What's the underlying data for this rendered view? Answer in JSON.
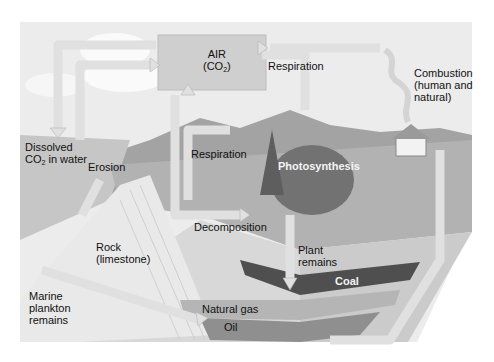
{
  "diagram": {
    "colors": {
      "sky": "#ececec",
      "air_box": "#cfcfcf",
      "arrow": "#e2e2e2",
      "arrow_edge": "#b4b4b4",
      "mountain": "#9a9a9a",
      "ground": "#a8a8a8",
      "water": "#c4c4c4",
      "rock": "#e6e6e6",
      "tree": "#6e6e6e",
      "coal": "#4a4a4a",
      "gas": "#b0b0b0",
      "oil": "#8c8c8c"
    },
    "labels": {
      "air": "AIR",
      "air_formula_pre": "(CO",
      "air_formula_sub": "2",
      "air_formula_post": ")",
      "respiration_top": "Respiration",
      "combustion_line1": "Combustion",
      "combustion_line2": "(human and",
      "combustion_line3": "natural)",
      "dissolved_line1": "Dissolved",
      "dissolved_pre": "CO",
      "dissolved_sub": "2",
      "dissolved_post": " in water",
      "erosion": "Erosion",
      "respiration_animals": "Respiration",
      "photosynthesis": "Photosynthesis",
      "decomposition": "Decomposition",
      "rock_line1": "Rock",
      "rock_line2": "(limestone)",
      "plant_line1": "Plant",
      "plant_line2": "remains",
      "coal": "Coal",
      "marine_line1": "Marine",
      "marine_line2": "plankton",
      "marine_line3": "remains",
      "natural_gas": "Natural gas",
      "oil": "Oil"
    }
  }
}
